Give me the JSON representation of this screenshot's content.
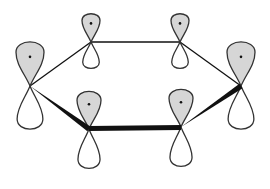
{
  "diagram": {
    "title": "Benzene p-orbitals (pi system)",
    "colors": {
      "background": "#ffffff",
      "outline": "#333333",
      "shaded_lobe": "#d6d6d6",
      "unshaded_lobe": "#ffffff",
      "bond": "#111111"
    },
    "orbitals": [
      {
        "id": "C1",
        "position": "left",
        "node": [
          30,
          86
        ],
        "up": 47,
        "down": 46,
        "width": 28
      },
      {
        "id": "C2",
        "position": "top-left",
        "node": [
          91,
          42
        ],
        "up": 30,
        "down": 28,
        "width": 18
      },
      {
        "id": "C3",
        "position": "top-right",
        "node": [
          180,
          42
        ],
        "up": 30,
        "down": 28,
        "width": 18
      },
      {
        "id": "C4",
        "position": "right",
        "node": [
          241,
          86
        ],
        "up": 47,
        "down": 46,
        "width": 28
      },
      {
        "id": "C5",
        "position": "bottom-right",
        "node": [
          181,
          127
        ],
        "up": 40,
        "down": 42,
        "width": 24
      },
      {
        "id": "C6",
        "position": "bottom-left",
        "node": [
          89,
          129
        ],
        "up": 40,
        "down": 42,
        "width": 24
      }
    ],
    "bonds": [
      {
        "from": "C1",
        "to": "C2",
        "style": "thin"
      },
      {
        "from": "C2",
        "to": "C3",
        "style": "thin"
      },
      {
        "from": "C3",
        "to": "C4",
        "style": "thin"
      },
      {
        "from": "C1",
        "to": "C6",
        "style": "wedge"
      },
      {
        "from": "C6",
        "to": "C5",
        "style": "bold"
      },
      {
        "from": "C5",
        "to": "C4",
        "style": "wedge"
      }
    ]
  }
}
